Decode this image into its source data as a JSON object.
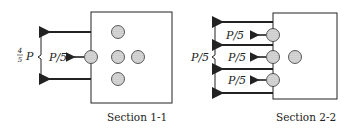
{
  "section1": {
    "caption": "Section 1-1",
    "bracket_label_num": "4",
    "bracket_label_den": "5",
    "bracket_label_var": "P",
    "bolt_force_label": "P/5"
  },
  "section2": {
    "caption": "Section 2-2",
    "bracket_label": "P/5",
    "bolt_force_labels": [
      "P/5",
      "P/5",
      "P/5"
    ]
  },
  "colors": {
    "line": "#222222",
    "bolt_fill": "#cfcfcf",
    "plate_fill": "#ffffff"
  }
}
